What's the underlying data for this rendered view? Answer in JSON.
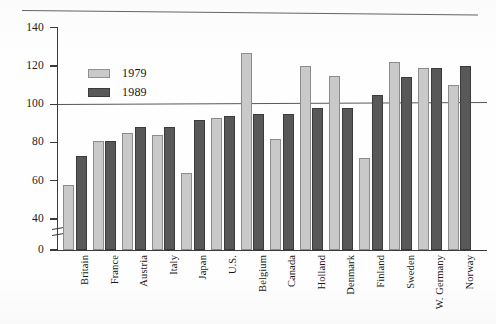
{
  "figure": {
    "has_top_rule": true,
    "axis_break": true,
    "reference_line_value": 100
  },
  "legend": {
    "position": "upper-left-inside",
    "entries": [
      {
        "label": "1979",
        "color": "#c9c9c9"
      },
      {
        "label": "1989",
        "color": "#585858"
      }
    ]
  },
  "chart_data": {
    "type": "bar",
    "title": "",
    "subtitle": "",
    "xlabel": "",
    "ylabel": "",
    "ylim": [
      0,
      140
    ],
    "yticks": [
      0,
      40,
      60,
      80,
      100,
      120,
      140
    ],
    "ytick_labels": [
      "0",
      "40",
      "60",
      "80",
      "100",
      "120",
      "140"
    ],
    "y_axis_break_after": 0,
    "grid": false,
    "reference_lines": [
      {
        "value": 100,
        "orientation": "horizontal"
      }
    ],
    "legend_position": "upper left",
    "categories": [
      "Britain",
      "France",
      "Austria",
      "Italy",
      "Japan",
      "U.S.",
      "Belgium",
      "Canada",
      "Holland",
      "Denmark",
      "Finland",
      "Sweden",
      "W. Germany",
      "Norway"
    ],
    "series": [
      {
        "name": "1979",
        "color": "#c9c9c9",
        "values": [
          58,
          81,
          85,
          84,
          64,
          93,
          127,
          82,
          120,
          115,
          72,
          122,
          119,
          110
        ]
      },
      {
        "name": "1989",
        "color": "#585858",
        "values": [
          73,
          81,
          88,
          88,
          92,
          94,
          95,
          95,
          98,
          98,
          105,
          114,
          119,
          120
        ]
      }
    ]
  }
}
